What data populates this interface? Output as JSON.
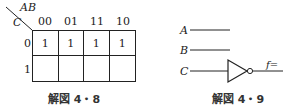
{
  "kmap": {
    "corner_top": "AB",
    "corner_left": "C",
    "columns": [
      "00",
      "01",
      "11",
      "10"
    ],
    "rows": [
      "0",
      "1"
    ],
    "cells": [
      [
        "1",
        "1",
        "1",
        "1"
      ],
      [
        "",
        "",
        "",
        ""
      ]
    ],
    "caption": "解図 4・8"
  },
  "circuit": {
    "inputs": [
      "A",
      "B",
      "C"
    ],
    "gate": "NOT",
    "output_label": "f=",
    "caption": "解図 4・9"
  },
  "colors": {
    "line": "#222222",
    "background": "#ffffff"
  }
}
